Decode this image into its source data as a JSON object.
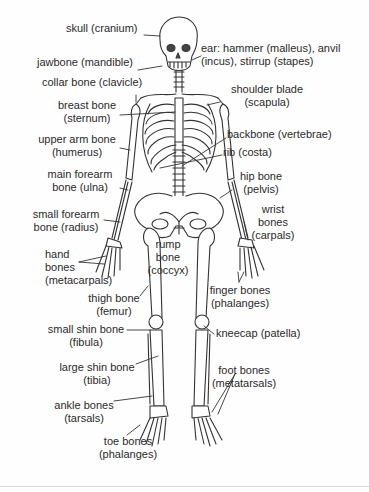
{
  "diagram": {
    "line_color": "#333333",
    "labels": [
      {
        "id": "skull",
        "text": "skull (cranium)",
        "x": 66,
        "y": 27,
        "align": "left"
      },
      {
        "id": "ear",
        "text": "ear: hammer (malleus), anvil",
        "text2": "(incus), stirrup (stapes)",
        "x": 201,
        "y": 42,
        "align": "left"
      },
      {
        "id": "jawbone",
        "text": "jawbone (mandible)",
        "x": 37,
        "y": 60,
        "align": "left"
      },
      {
        "id": "collar",
        "text": "collar bone (clavicle)",
        "x": 42,
        "y": 79,
        "align": "left"
      },
      {
        "id": "shoulder",
        "text": "shoulder blade",
        "text2": "(scapula)",
        "x": 208,
        "y": 87,
        "align": "center",
        "w": 118
      },
      {
        "id": "breast",
        "text": "breast bone",
        "text2": "(sternum)",
        "x": 52,
        "y": 101,
        "align": "center",
        "w": 70
      },
      {
        "id": "backbone",
        "text": "backbone (vertebrae)",
        "x": 227,
        "y": 132,
        "align": "left"
      },
      {
        "id": "upperarm",
        "text": "upper arm bone",
        "text2": "(humerus)",
        "x": 34,
        "y": 134,
        "align": "center",
        "w": 86
      },
      {
        "id": "rib",
        "text": "rib (costa)",
        "x": 223,
        "y": 149,
        "align": "left"
      },
      {
        "id": "ulna",
        "text": "main forearm",
        "text2": "bone (ulna)",
        "x": 40,
        "y": 168,
        "align": "center",
        "w": 80
      },
      {
        "id": "hip",
        "text": "hip bone",
        "text2": "(pelvis)",
        "x": 232,
        "y": 170,
        "align": "center",
        "w": 58
      },
      {
        "id": "radius",
        "text": "small forearm",
        "text2": "bone (radius)",
        "x": 28,
        "y": 206,
        "align": "center",
        "w": 76
      },
      {
        "id": "wrist",
        "text": "wrist",
        "text2": "bones",
        "text3": "(carpals)",
        "x": 243,
        "y": 203,
        "align": "right",
        "w": 60
      },
      {
        "id": "rump",
        "text": "rump",
        "text2": "bone",
        "text3": "(coccyx)",
        "x": 145,
        "y": 238,
        "align": "center",
        "w": 46
      },
      {
        "id": "hand",
        "text": "hand",
        "text2": "bones",
        "text3": "(metacarpals)",
        "x": 45,
        "y": 248,
        "align": "left"
      },
      {
        "id": "finger",
        "text": "finger bones",
        "text2": "(phalanges)",
        "x": 206,
        "y": 284,
        "align": "center",
        "w": 68
      },
      {
        "id": "thigh",
        "text": "thigh bone",
        "text2": "(femur)",
        "x": 86,
        "y": 292,
        "align": "center",
        "w": 56
      },
      {
        "id": "kneecap",
        "text": "kneecap (patella)",
        "x": 216,
        "y": 327,
        "align": "left"
      },
      {
        "id": "fibula",
        "text": "small shin bone",
        "text2": "(fibula)",
        "x": 45,
        "y": 323,
        "align": "center",
        "w": 82
      },
      {
        "id": "tibia",
        "text": "large shin bone",
        "text2": "(tibia)",
        "x": 57,
        "y": 361,
        "align": "center",
        "w": 80
      },
      {
        "id": "footbones",
        "text": "foot bones",
        "text2": "(metatarsals)",
        "x": 209,
        "y": 367,
        "align": "center",
        "w": 70
      },
      {
        "id": "ankle",
        "text": "ankle bones",
        "text2": "(tarsals)",
        "x": 54,
        "y": 397,
        "align": "center",
        "w": 60
      },
      {
        "id": "toe",
        "text": "toe bones",
        "text2": "(phalanges)",
        "x": 96,
        "y": 435,
        "align": "center",
        "w": 64
      }
    ]
  }
}
